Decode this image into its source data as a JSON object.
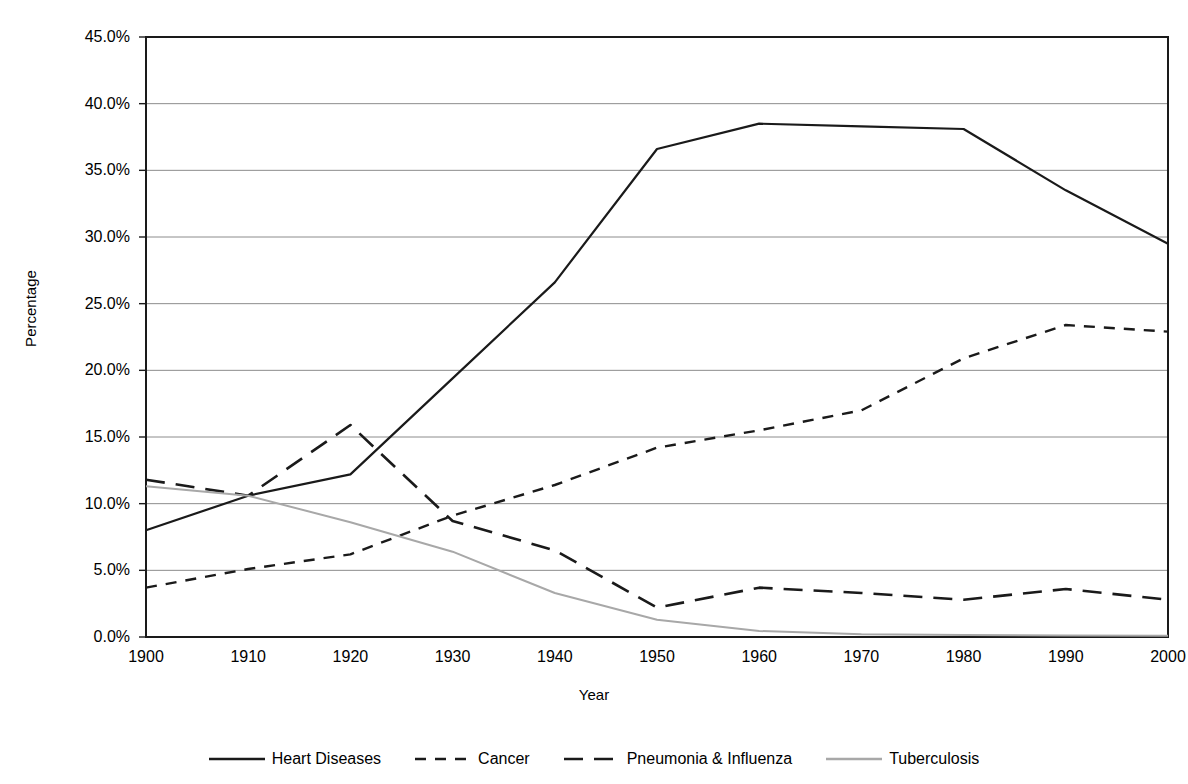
{
  "chart_data": {
    "type": "line",
    "title": "",
    "xlabel": "Year",
    "ylabel": "Percentage",
    "x": [
      1900,
      1910,
      1920,
      1930,
      1940,
      1950,
      1960,
      1970,
      1980,
      1990,
      2000
    ],
    "xlim": [
      1900,
      2000
    ],
    "ylim": [
      0,
      45
    ],
    "ytick_values": [
      0,
      5,
      10,
      15,
      20,
      25,
      30,
      35,
      40,
      45
    ],
    "ytick_labels": [
      "0.0%",
      "5.0%",
      "10.0%",
      "15.0%",
      "20.0%",
      "25.0%",
      "30.0%",
      "35.0%",
      "40.0%",
      "45.0%"
    ],
    "xtick_labels": [
      "1900",
      "1910",
      "1920",
      "1930",
      "1940",
      "1950",
      "1960",
      "1970",
      "1980",
      "1990",
      "2000"
    ],
    "grid": "horizontal",
    "legend_position": "bottom",
    "series": [
      {
        "name": "Heart Diseases",
        "style": "solid",
        "color": "#1a1a1a",
        "width": 2.2,
        "values": [
          8.0,
          10.6,
          12.2,
          19.4,
          26.6,
          36.6,
          38.5,
          38.3,
          38.1,
          33.5,
          29.5
        ]
      },
      {
        "name": "Cancer",
        "style": "dashed-short",
        "color": "#1a1a1a",
        "width": 2.4,
        "values": [
          3.7,
          5.1,
          6.2,
          9.1,
          11.4,
          14.2,
          15.5,
          17.0,
          20.9,
          23.4,
          22.9
        ]
      },
      {
        "name": "Pneumonia & Influenza",
        "style": "dashed-long",
        "color": "#1a1a1a",
        "width": 2.6,
        "values": [
          11.8,
          10.6,
          15.9,
          8.7,
          6.5,
          2.2,
          3.7,
          3.3,
          2.8,
          3.6,
          2.8
        ]
      },
      {
        "name": "Tuberculosis",
        "style": "solid",
        "color": "#a8a8a8",
        "width": 2.0,
        "values": [
          11.3,
          10.6,
          8.6,
          6.4,
          3.3,
          1.3,
          0.45,
          0.2,
          0.15,
          0.12,
          0.1
        ]
      }
    ],
    "legend": [
      {
        "label": "Heart Diseases",
        "style": "solid",
        "color": "#1a1a1a"
      },
      {
        "label": "Cancer",
        "style": "dashed-short",
        "color": "#1a1a1a"
      },
      {
        "label": "Pneumonia & Influenza",
        "style": "dashed-long",
        "color": "#1a1a1a"
      },
      {
        "label": "Tuberculosis",
        "style": "solid",
        "color": "#a8a8a8"
      }
    ],
    "axis": {
      "frame_color": "#1a1a1a",
      "grid_color": "#8c8c8c"
    }
  }
}
